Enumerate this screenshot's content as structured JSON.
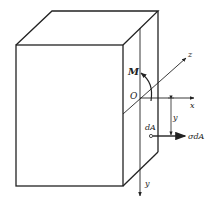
{
  "diagram": {
    "type": "beam-cross-section-bending",
    "labels": {
      "moment": "M",
      "origin": "O",
      "z_axis": "z",
      "x_axis": "x",
      "y_axis": "y",
      "y_distance": "y",
      "area_element": "dA",
      "force": "σdA"
    },
    "colors": {
      "line": "#222222",
      "background": "#ffffff"
    }
  }
}
